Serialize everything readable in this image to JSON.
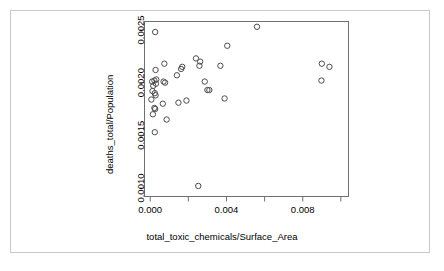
{
  "chart_data": {
    "type": "scatter",
    "title": "",
    "xlabel": "total_toxic_chemicals/Surface_Area",
    "ylabel": "deaths_total/Population",
    "xlim": [
      -0.0003,
      0.0104
    ],
    "ylim": [
      0.00092,
      0.00258
    ],
    "grid": false,
    "legend": null,
    "marker": "open-circle",
    "marker_color": "#4d4d4d",
    "xticks": [
      0.0,
      0.002,
      0.004,
      0.006,
      0.008,
      0.01
    ],
    "xtick_labels": [
      "0.000",
      "",
      "0.004",
      "",
      "0.008",
      ""
    ],
    "yticks": [
      0.001,
      0.0015,
      0.002,
      0.0025
    ],
    "ytick_labels": [
      "0.0010",
      "0.0015",
      "0.0020",
      "0.0025"
    ],
    "points": [
      {
        "x": 0.00026,
        "y": 0.00248
      },
      {
        "x": 0.00028,
        "y": 0.00212
      },
      {
        "x": 0.00022,
        "y": 0.00202
      },
      {
        "x": 0.0001,
        "y": 0.00201
      },
      {
        "x": 0.00032,
        "y": 0.00203
      },
      {
        "x": 0.0003,
        "y": 0.00199
      },
      {
        "x": 0.00016,
        "y": 0.00197
      },
      {
        "x": 0.00012,
        "y": 0.00192
      },
      {
        "x": 0.00024,
        "y": 0.0019
      },
      {
        "x": 0.00028,
        "y": 0.00188
      },
      {
        "x": 6e-05,
        "y": 0.00184
      },
      {
        "x": 0.00022,
        "y": 0.00176
      },
      {
        "x": 0.00026,
        "y": 0.00175
      },
      {
        "x": 0.00014,
        "y": 0.0017
      },
      {
        "x": 0.00024,
        "y": 0.00153
      },
      {
        "x": 0.00074,
        "y": 0.00218
      },
      {
        "x": 0.0007,
        "y": 0.00201
      },
      {
        "x": 0.00078,
        "y": 0.002
      },
      {
        "x": 0.00066,
        "y": 0.0018
      },
      {
        "x": 0.00086,
        "y": 0.00165
      },
      {
        "x": 0.0014,
        "y": 0.00207
      },
      {
        "x": 0.00162,
        "y": 0.00213
      },
      {
        "x": 0.00168,
        "y": 0.00215
      },
      {
        "x": 0.00148,
        "y": 0.00181
      },
      {
        "x": 0.0019,
        "y": 0.00183
      },
      {
        "x": 0.0024,
        "y": 0.00223
      },
      {
        "x": 0.00258,
        "y": 0.00216
      },
      {
        "x": 0.00262,
        "y": 0.0022
      },
      {
        "x": 0.00252,
        "y": 0.00102
      },
      {
        "x": 0.00286,
        "y": 0.00201
      },
      {
        "x": 0.003,
        "y": 0.00193
      },
      {
        "x": 0.0031,
        "y": 0.00193
      },
      {
        "x": 0.00368,
        "y": 0.00216
      },
      {
        "x": 0.00404,
        "y": 0.00235
      },
      {
        "x": 0.0039,
        "y": 0.00185
      },
      {
        "x": 0.0056,
        "y": 0.00253
      },
      {
        "x": 0.009,
        "y": 0.00218
      },
      {
        "x": 0.0094,
        "y": 0.00215
      },
      {
        "x": 0.00898,
        "y": 0.00202
      }
    ]
  },
  "axes": {
    "x_title": "total_toxic_chemicals/Surface_Area",
    "y_title": "deaths_total/Population"
  }
}
